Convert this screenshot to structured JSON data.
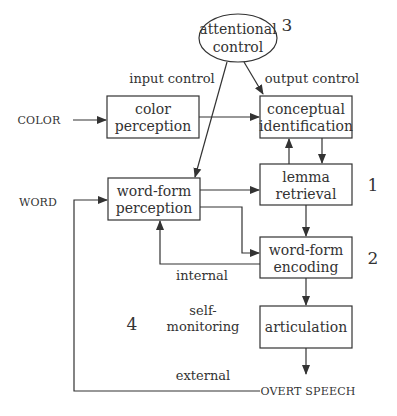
{
  "diagram": {
    "title": "",
    "nodes": {
      "attentional_control": {
        "line1": "attentional",
        "line2": "control",
        "number": "3"
      },
      "color_perception": {
        "line1": "color",
        "line2": "perception"
      },
      "conceptual_identification": {
        "line1": "conceptual",
        "line2": "identification"
      },
      "word_form_perception": {
        "line1": "word-form",
        "line2": "perception"
      },
      "lemma_retrieval": {
        "line1": "lemma",
        "line2": "retrieval",
        "number": "1"
      },
      "word_form_encoding": {
        "line1": "word-form",
        "line2": "encoding",
        "number": "2"
      },
      "articulation": {
        "line1": "articulation"
      }
    },
    "inputs": {
      "color": "COLOR",
      "word": "WORD"
    },
    "output": "OVERT SPEECH",
    "edge_labels": {
      "input_control": "input control",
      "output_control": "output control",
      "internal": "internal",
      "self_monitoring_line1": "self-",
      "self_monitoring_line2": "monitoring",
      "external": "external",
      "self_monitoring_number": "4"
    },
    "edges": [
      {
        "from": "COLOR",
        "to": "color perception"
      },
      {
        "from": "color perception",
        "to": "conceptual identification"
      },
      {
        "from": "attentional control",
        "to": "conceptual identification",
        "label": "output control"
      },
      {
        "from": "attentional control",
        "to": "word-form perception",
        "label": "input control"
      },
      {
        "from": "conceptual identification",
        "to": "lemma retrieval"
      },
      {
        "from": "lemma retrieval",
        "to": "conceptual identification"
      },
      {
        "from": "word-form perception",
        "to": "lemma retrieval"
      },
      {
        "from": "word-form perception",
        "to": "word-form encoding"
      },
      {
        "from": "lemma retrieval",
        "to": "word-form encoding"
      },
      {
        "from": "word-form encoding",
        "to": "word-form perception",
        "label": "internal"
      },
      {
        "from": "word-form encoding",
        "to": "articulation"
      },
      {
        "from": "articulation",
        "to": "OVERT SPEECH"
      },
      {
        "from": "OVERT SPEECH",
        "to": "word-form perception",
        "label": "external"
      },
      {
        "from": "WORD",
        "to": "word-form perception"
      }
    ]
  }
}
